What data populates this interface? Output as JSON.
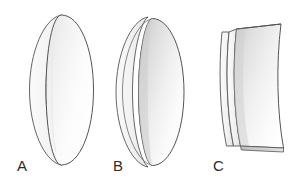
{
  "figure": {
    "background_color": "#ffffff",
    "stroke_color": "#4a4a4a",
    "label_color": "#2b2b2b",
    "items": [
      {
        "id": "a",
        "label": "A",
        "name": "thin-disc",
        "fill_light": "#ffffff",
        "fill_dark": "#ededed",
        "rim_fill": "#f7f7f7"
      },
      {
        "id": "b",
        "label": "B",
        "name": "thick-disc",
        "fill_light": "#ffffff",
        "fill_dark": "#d4d4d4",
        "rim_fill": "#f4f4f4"
      },
      {
        "id": "c",
        "label": "C",
        "name": "truncated-disc",
        "fill_light": "#ffffff",
        "fill_dark": "#d9d9d9",
        "rim_fill": "#f4f4f4"
      }
    ]
  }
}
